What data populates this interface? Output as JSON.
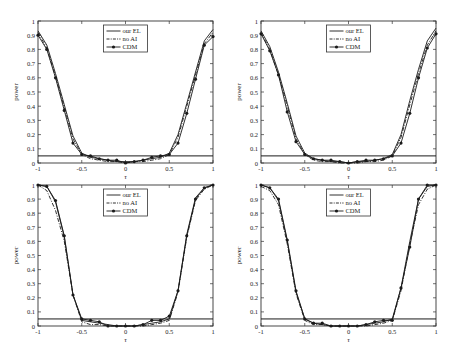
{
  "chart_data": [
    {
      "type": "line",
      "panel": "top-left",
      "title": "",
      "xlabel": "τ",
      "ylabel": "power",
      "xlim": [
        -1,
        1
      ],
      "ylim": [
        0,
        1
      ],
      "xticks": [
        "-1",
        "-0.5",
        "0",
        "0.5",
        "1"
      ],
      "yticks": [
        "0",
        "0.1",
        "0.2",
        "0.3",
        "0.4",
        "0.5",
        "0.6",
        "0.7",
        "0.8",
        "0.9",
        "1"
      ],
      "grid": false,
      "legend_position": "top-center",
      "reference_line": 0.05,
      "x": [
        -1,
        -0.9,
        -0.8,
        -0.7,
        -0.6,
        -0.5,
        -0.4,
        -0.3,
        -0.2,
        -0.1,
        0,
        0.1,
        0.2,
        0.3,
        0.4,
        0.5,
        0.6,
        0.7,
        0.8,
        0.9,
        1
      ],
      "series": [
        {
          "name": "our EL",
          "style": "solid",
          "values": [
            0.93,
            0.83,
            0.63,
            0.41,
            0.19,
            0.07,
            0.04,
            0.03,
            0.02,
            0.01,
            0.01,
            0.01,
            0.02,
            0.03,
            0.04,
            0.07,
            0.2,
            0.42,
            0.64,
            0.86,
            0.94
          ]
        },
        {
          "name": "no AI",
          "style": "dashdot",
          "values": [
            0.92,
            0.81,
            0.61,
            0.39,
            0.17,
            0.06,
            0.03,
            0.02,
            0.01,
            0.01,
            0.0,
            0.01,
            0.01,
            0.02,
            0.03,
            0.06,
            0.18,
            0.4,
            0.62,
            0.84,
            0.92
          ]
        },
        {
          "name": "CDM",
          "style": "solid-marker",
          "values": [
            0.9,
            0.8,
            0.6,
            0.37,
            0.14,
            0.06,
            0.05,
            0.03,
            0.02,
            0.02,
            0.0,
            0.01,
            0.02,
            0.04,
            0.05,
            0.06,
            0.14,
            0.35,
            0.59,
            0.83,
            0.89
          ]
        }
      ]
    },
    {
      "type": "line",
      "panel": "top-right",
      "title": "",
      "xlabel": "τ",
      "ylabel": "power",
      "xlim": [
        -1,
        1
      ],
      "ylim": [
        0,
        1
      ],
      "xticks": [
        "-1",
        "-0.5",
        "0",
        "0.5",
        "1"
      ],
      "yticks": [
        "0",
        "0.1",
        "0.2",
        "0.3",
        "0.4",
        "0.5",
        "0.6",
        "0.7",
        "0.8",
        "0.9",
        "1"
      ],
      "grid": false,
      "legend_position": "top-center",
      "reference_line": 0.05,
      "x": [
        -1,
        -0.9,
        -0.8,
        -0.7,
        -0.6,
        -0.5,
        -0.4,
        -0.3,
        -0.2,
        -0.1,
        0,
        0.1,
        0.2,
        0.3,
        0.4,
        0.5,
        0.6,
        0.7,
        0.8,
        0.9,
        1
      ],
      "series": [
        {
          "name": "our EL",
          "style": "solid",
          "values": [
            0.93,
            0.82,
            0.64,
            0.42,
            0.19,
            0.07,
            0.03,
            0.02,
            0.01,
            0.01,
            0.0,
            0.01,
            0.01,
            0.02,
            0.03,
            0.06,
            0.2,
            0.44,
            0.66,
            0.86,
            0.95
          ]
        },
        {
          "name": "no AI",
          "style": "dashdot",
          "values": [
            0.92,
            0.8,
            0.62,
            0.4,
            0.17,
            0.06,
            0.02,
            0.01,
            0.01,
            0.0,
            0.0,
            0.0,
            0.01,
            0.01,
            0.02,
            0.05,
            0.18,
            0.41,
            0.63,
            0.83,
            0.93
          ]
        },
        {
          "name": "CDM",
          "style": "solid-marker",
          "values": [
            0.91,
            0.79,
            0.62,
            0.36,
            0.15,
            0.06,
            0.03,
            0.02,
            0.02,
            0.01,
            0.0,
            0.01,
            0.02,
            0.02,
            0.03,
            0.05,
            0.14,
            0.35,
            0.6,
            0.81,
            0.91
          ]
        }
      ]
    },
    {
      "type": "line",
      "panel": "bottom-left",
      "title": "",
      "xlabel": "τ",
      "ylabel": "power",
      "xlim": [
        -1,
        1
      ],
      "ylim": [
        0,
        1
      ],
      "xticks": [
        "-1",
        "-0.5",
        "0",
        "0.5",
        "1"
      ],
      "yticks": [
        "0",
        "0.1",
        "0.2",
        "0.3",
        "0.4",
        "0.5",
        "0.6",
        "0.7",
        "0.8",
        "0.9",
        "1"
      ],
      "grid": false,
      "legend_position": "top-center",
      "reference_line": 0.05,
      "x": [
        -1,
        -0.9,
        -0.8,
        -0.7,
        -0.6,
        -0.5,
        -0.4,
        -0.3,
        -0.2,
        -0.1,
        0,
        0.1,
        0.2,
        0.3,
        0.4,
        0.5,
        0.6,
        0.7,
        0.8,
        0.9,
        1
      ],
      "series": [
        {
          "name": "our EL",
          "style": "solid",
          "values": [
            1.0,
            0.99,
            0.88,
            0.63,
            0.22,
            0.04,
            0.03,
            0.02,
            0.01,
            0.0,
            0.0,
            0.0,
            0.01,
            0.02,
            0.03,
            0.05,
            0.25,
            0.65,
            0.91,
            0.98,
            1.0
          ]
        },
        {
          "name": "no AI",
          "style": "dashdot",
          "values": [
            1.0,
            0.96,
            0.82,
            0.6,
            0.22,
            0.03,
            0.01,
            0.01,
            0.0,
            0.0,
            0.0,
            0.0,
            0.0,
            0.01,
            0.02,
            0.04,
            0.24,
            0.63,
            0.89,
            0.97,
            1.0
          ]
        },
        {
          "name": "CDM",
          "style": "solid-marker",
          "values": [
            1.0,
            0.99,
            0.89,
            0.64,
            0.22,
            0.05,
            0.04,
            0.03,
            0.0,
            0.0,
            0.0,
            0.0,
            0.01,
            0.04,
            0.04,
            0.07,
            0.25,
            0.64,
            0.9,
            0.98,
            1.0
          ]
        }
      ]
    },
    {
      "type": "line",
      "panel": "bottom-right",
      "title": "",
      "xlabel": "τ",
      "ylabel": "power",
      "xlim": [
        -1,
        1
      ],
      "ylim": [
        0,
        1
      ],
      "xticks": [
        "-1",
        "-0.5",
        "0",
        "0.5",
        "1"
      ],
      "yticks": [
        "0",
        "0.1",
        "0.2",
        "0.3",
        "0.4",
        "0.5",
        "0.6",
        "0.7",
        "0.8",
        "0.9",
        "1"
      ],
      "grid": false,
      "legend_position": "top-center",
      "reference_line": 0.05,
      "x": [
        -1,
        -0.9,
        -0.8,
        -0.7,
        -0.6,
        -0.5,
        -0.4,
        -0.3,
        -0.2,
        -0.1,
        0,
        0.1,
        0.2,
        0.3,
        0.4,
        0.5,
        0.6,
        0.7,
        0.8,
        0.9,
        1
      ],
      "series": [
        {
          "name": "our EL",
          "style": "solid",
          "values": [
            1.0,
            0.98,
            0.89,
            0.6,
            0.24,
            0.05,
            0.02,
            0.01,
            0.0,
            0.0,
            0.0,
            0.0,
            0.01,
            0.02,
            0.03,
            0.05,
            0.27,
            0.6,
            0.9,
            0.99,
            1.0
          ]
        },
        {
          "name": "no AI",
          "style": "dashdot",
          "values": [
            0.99,
            0.96,
            0.86,
            0.58,
            0.23,
            0.04,
            0.01,
            0.01,
            0.0,
            0.0,
            0.0,
            0.0,
            0.0,
            0.01,
            0.02,
            0.04,
            0.25,
            0.58,
            0.86,
            0.97,
            1.0
          ]
        },
        {
          "name": "CDM",
          "style": "solid-marker",
          "values": [
            1.0,
            0.98,
            0.9,
            0.61,
            0.25,
            0.05,
            0.02,
            0.02,
            0.0,
            0.0,
            0.0,
            0.0,
            0.01,
            0.03,
            0.04,
            0.04,
            0.27,
            0.56,
            0.9,
            1.0,
            1.0
          ]
        }
      ]
    }
  ],
  "legend": {
    "entries": [
      "our EL",
      "no AI",
      "CDM"
    ]
  },
  "colors": {
    "line": "#1a1a1a",
    "axis": "#333333",
    "text": "#222222"
  }
}
